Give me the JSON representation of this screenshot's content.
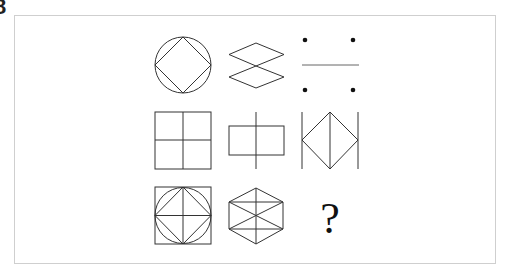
{
  "puzzle": {
    "corner_label": "8",
    "stroke_color": "#333333",
    "frame_color": "#cfcfcf",
    "grid": [
      [
        "circle-with-inscribed-diamond",
        "two-stacked-rhombi",
        "four-dots-with-horizontal-line"
      ],
      [
        "square-with-cross",
        "rectangle-with-vertical-line",
        "diamond-between-two-vertical-lines"
      ],
      [
        "square-with-circle-diamond-cross",
        "hexagon-with-diagonals",
        "unknown"
      ]
    ],
    "missing_cell_text": "?"
  }
}
